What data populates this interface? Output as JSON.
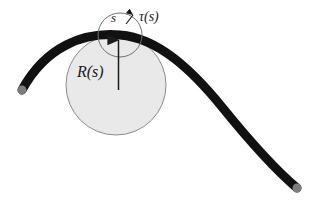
{
  "figure": {
    "name": "osculating-circle-curve-diagram",
    "background_color": "#ffffff",
    "width": 316,
    "height": 204
  },
  "labels": {
    "arclength": "s",
    "tangent": "τ(s)",
    "radius": "R(s)"
  },
  "colors": {
    "curve": "#111111",
    "endpoint_cap": "#7d7d7d",
    "circle_fill": "#e9e9e9",
    "circle_stroke": "#8c8c8c",
    "arrow": "#1a1a1a",
    "text": "#1a1a1a"
  },
  "geometry": {
    "curve": {
      "type": "cubic-bezier-path",
      "stroke_width": 9,
      "start_point": [
        22,
        90
      ],
      "control_point_1": [
        60,
        30
      ],
      "control_point_2": [
        170,
        25
      ],
      "mid_point": [
        210,
        85
      ],
      "control_point_3": [
        245,
        135
      ],
      "control_point_4": [
        280,
        160
      ],
      "end_point": [
        297,
        188
      ],
      "apex": [
        120,
        35
      ]
    },
    "osculating_circle": {
      "center": [
        116,
        85
      ],
      "radius": 50,
      "stroke_width": 1
    },
    "small_arc": {
      "center": [
        120,
        35
      ],
      "radius": 22,
      "stroke_width": 1
    },
    "radius_arrow": {
      "from": [
        118,
        88
      ],
      "to": [
        119,
        36
      ],
      "stroke_width": 1.4,
      "head_length": 8,
      "head_width": 6
    },
    "tangent_arrow": {
      "from": [
        127,
        22
      ],
      "to": [
        134,
        14
      ],
      "stroke_width": 1.2,
      "head_length": 5,
      "head_width": 4
    },
    "endpoint_caps": [
      {
        "center": [
          22,
          90
        ],
        "radius": 5
      },
      {
        "center": [
          297,
          188
        ],
        "radius": 5
      }
    ]
  }
}
